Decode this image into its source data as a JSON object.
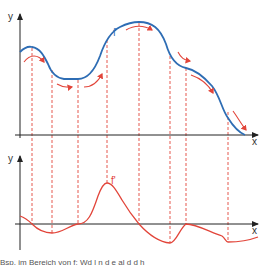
{
  "diagram": {
    "top_graph": {
      "y_axis_label": "y",
      "x_axis_label": "x",
      "curve_label": "f",
      "curve_color": "#2e6db4",
      "arrow_color": "#e2453a"
    },
    "bottom_graph": {
      "y_axis_label": "y",
      "x_axis_label": "x",
      "curve_label": "f'",
      "curve_color": "#e2453a"
    },
    "guide_line_color": "#e2453a",
    "guide_lines_x": [
      32,
      52,
      78,
      107,
      139,
      170,
      186,
      228
    ],
    "caption": "Bsp.    im Bereich von f: Wd  l  n  d  e  al  d  d  h  "
  }
}
